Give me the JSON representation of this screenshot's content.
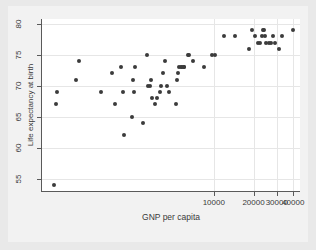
{
  "chart_data": {
    "type": "scatter",
    "title": "",
    "xlabel": "GNP per capita",
    "ylabel": "Life expectancy at birth",
    "xscale": "log",
    "yscale": "linear",
    "xlim": [
      500,
      45000
    ],
    "ylim": [
      53,
      80.8
    ],
    "xticks": [
      10000,
      20000,
      30000,
      40000
    ],
    "xticklabels": [
      "10000",
      "20000",
      "30000",
      "40000"
    ],
    "yticks": [
      55,
      60,
      65,
      70,
      75,
      80
    ],
    "yticklabels": [
      "55",
      "60",
      "65",
      "70",
      "75",
      "80"
    ],
    "grid": true,
    "legend": "none",
    "marker": "filled-circle",
    "marker_color": "#3b3b3b",
    "points": [
      {
        "x": 620,
        "y": 54
      },
      {
        "x": 640,
        "y": 67
      },
      {
        "x": 650,
        "y": 69
      },
      {
        "x": 900,
        "y": 71
      },
      {
        "x": 950,
        "y": 74
      },
      {
        "x": 1400,
        "y": 69
      },
      {
        "x": 1700,
        "y": 72
      },
      {
        "x": 1800,
        "y": 67
      },
      {
        "x": 2000,
        "y": 73
      },
      {
        "x": 2050,
        "y": 69
      },
      {
        "x": 2100,
        "y": 62
      },
      {
        "x": 2400,
        "y": 65
      },
      {
        "x": 2450,
        "y": 71
      },
      {
        "x": 2500,
        "y": 69
      },
      {
        "x": 2550,
        "y": 73
      },
      {
        "x": 2900,
        "y": 64
      },
      {
        "x": 3100,
        "y": 75
      },
      {
        "x": 3200,
        "y": 70
      },
      {
        "x": 3300,
        "y": 70
      },
      {
        "x": 3350,
        "y": 71
      },
      {
        "x": 3400,
        "y": 68
      },
      {
        "x": 3600,
        "y": 67
      },
      {
        "x": 3700,
        "y": 68
      },
      {
        "x": 3900,
        "y": 69
      },
      {
        "x": 4000,
        "y": 70
      },
      {
        "x": 4100,
        "y": 72
      },
      {
        "x": 4300,
        "y": 74
      },
      {
        "x": 4400,
        "y": 70
      },
      {
        "x": 4600,
        "y": 69
      },
      {
        "x": 5200,
        "y": 67
      },
      {
        "x": 5300,
        "y": 71
      },
      {
        "x": 5400,
        "y": 72
      },
      {
        "x": 5500,
        "y": 73
      },
      {
        "x": 5600,
        "y": 73
      },
      {
        "x": 5700,
        "y": 73
      },
      {
        "x": 5900,
        "y": 73
      },
      {
        "x": 6000,
        "y": 73
      },
      {
        "x": 6400,
        "y": 75
      },
      {
        "x": 6500,
        "y": 75
      },
      {
        "x": 7000,
        "y": 74
      },
      {
        "x": 8500,
        "y": 73
      },
      {
        "x": 9700,
        "y": 75
      },
      {
        "x": 10300,
        "y": 75
      },
      {
        "x": 12000,
        "y": 78
      },
      {
        "x": 14500,
        "y": 78
      },
      {
        "x": 18500,
        "y": 76
      },
      {
        "x": 19500,
        "y": 79
      },
      {
        "x": 20500,
        "y": 78
      },
      {
        "x": 21500,
        "y": 77
      },
      {
        "x": 22500,
        "y": 77
      },
      {
        "x": 23000,
        "y": 78
      },
      {
        "x": 23500,
        "y": 79
      },
      {
        "x": 24000,
        "y": 79
      },
      {
        "x": 24500,
        "y": 78
      },
      {
        "x": 25000,
        "y": 77
      },
      {
        "x": 26000,
        "y": 77
      },
      {
        "x": 27000,
        "y": 77
      },
      {
        "x": 28000,
        "y": 78
      },
      {
        "x": 29000,
        "y": 77
      },
      {
        "x": 31000,
        "y": 76
      },
      {
        "x": 33000,
        "y": 78
      },
      {
        "x": 40000,
        "y": 79
      }
    ]
  }
}
